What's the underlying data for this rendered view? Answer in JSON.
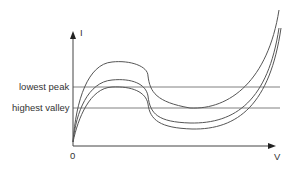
{
  "diagram": {
    "title": "",
    "axes": {
      "y_label": "I",
      "x_label": "V",
      "origin_label": "0"
    },
    "reference_lines": [
      {
        "label": "lowest peak",
        "y_px": 87
      },
      {
        "label": "highest valley",
        "y_px": 108
      }
    ],
    "curves": [
      {
        "name": "upper-curve",
        "peak_y_px": 62,
        "valley_y_px": 108
      },
      {
        "name": "middle-curve",
        "peak_y_px": 80,
        "valley_y_px": 123
      },
      {
        "name": "lower-curve",
        "peak_y_px": 87,
        "valley_y_px": 129
      }
    ],
    "colors": {
      "curve": "#555555",
      "axis": "#444444",
      "reference": "#777777",
      "text": "#333333"
    }
  }
}
